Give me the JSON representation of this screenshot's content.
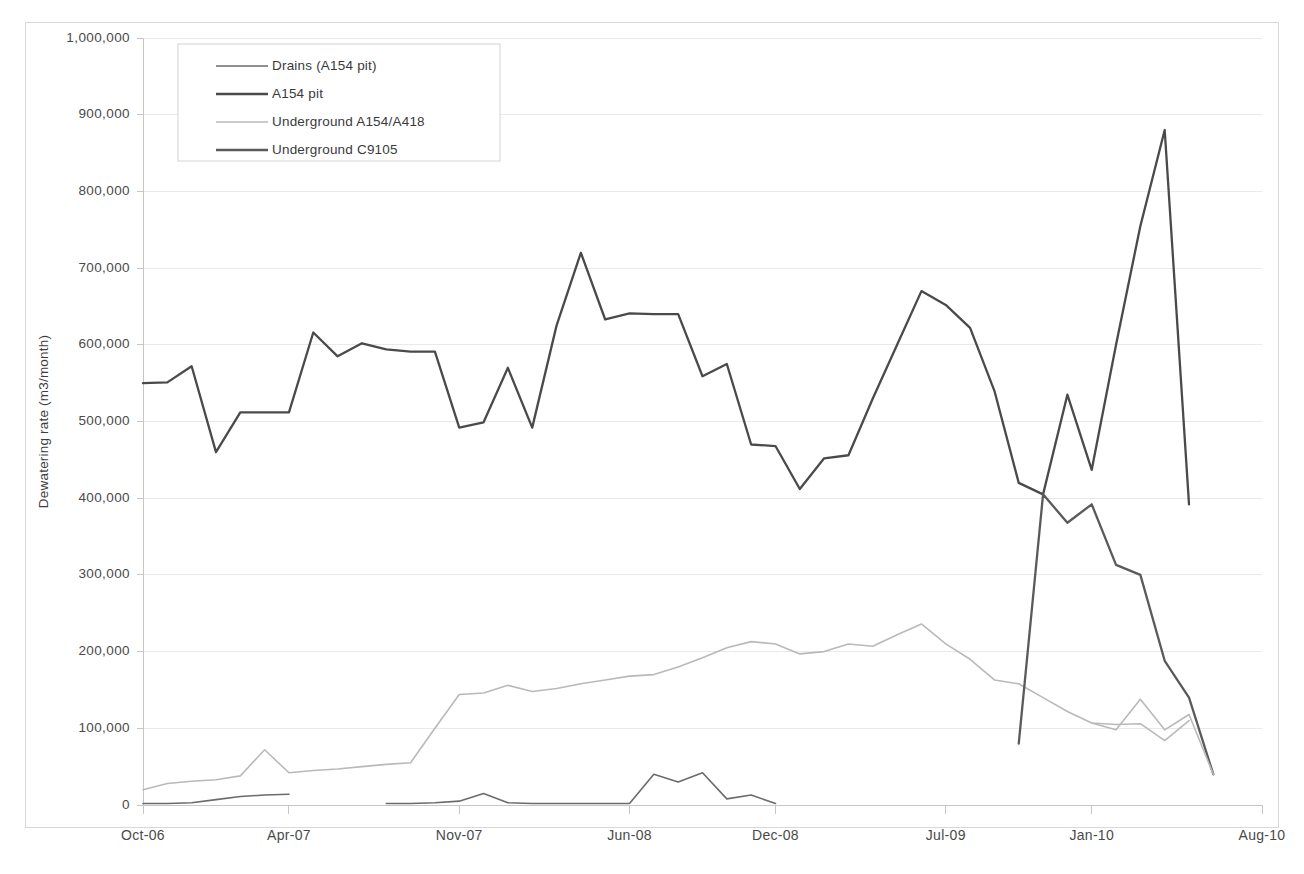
{
  "chart_data": {
    "type": "line",
    "title": "",
    "xlabel": "",
    "ylabel": "Dewatering rate (m3/month)",
    "ylim": [
      0,
      1000000
    ],
    "yticks": [
      0,
      100000,
      200000,
      300000,
      400000,
      500000,
      600000,
      700000,
      800000,
      900000,
      1000000
    ],
    "ytick_labels": [
      "0",
      "100,000",
      "200,000",
      "300,000",
      "400,000",
      "500,000",
      "600,000",
      "700,000",
      "800,000",
      "900,000",
      "1,000,000"
    ],
    "xlim": [
      0,
      46
    ],
    "xticks": [
      0,
      6,
      13,
      20,
      26,
      33,
      39,
      46
    ],
    "xtick_labels": [
      "Oct-06",
      "Apr-07",
      "Nov-07",
      "Jun-08",
      "Dec-08",
      "Jul-09",
      "Jan-10",
      "Aug-10"
    ],
    "grid": true,
    "legend_position": "top-left",
    "series": [
      {
        "name": "Drains (A154 pit)",
        "color": "#6b6b6b",
        "width": 1.6,
        "x": [
          0,
          1,
          2,
          3,
          4,
          5,
          6,
          7,
          8,
          9,
          10,
          11,
          12,
          13,
          14,
          15,
          16,
          17,
          18,
          19,
          20,
          21,
          22,
          23,
          24,
          25,
          26,
          27,
          28,
          29,
          30,
          31,
          32
        ],
        "values": [
          2000,
          2000,
          3000,
          7000,
          11000,
          13000,
          14000,
          null,
          null,
          null,
          2000,
          2000,
          3000,
          5000,
          15000,
          3000,
          2000,
          2000,
          2000,
          2000,
          2000,
          40000,
          30000,
          42000,
          8000,
          13000,
          2000,
          null,
          null,
          null,
          null,
          null,
          null
        ]
      },
      {
        "name": "A154 pit",
        "color": "#4a4a4a",
        "width": 2.3,
        "x": [
          0,
          1,
          2,
          3,
          4,
          5,
          6,
          7,
          8,
          9,
          10,
          11,
          12,
          13,
          14,
          15,
          16,
          17,
          18,
          19,
          20,
          21,
          22,
          23,
          24,
          25,
          26,
          27,
          28,
          29,
          30,
          31,
          32,
          33,
          34,
          35,
          36,
          37,
          38,
          39,
          40,
          41,
          42,
          43,
          44
        ],
        "values": [
          550000,
          551000,
          572000,
          460000,
          512000,
          512000,
          512000,
          616000,
          585000,
          602000,
          594000,
          591000,
          591000,
          492000,
          499000,
          570000,
          492000,
          625000,
          720000,
          633000,
          641000,
          640000,
          640000,
          559000,
          575000,
          470000,
          468000,
          412000,
          452000,
          456000,
          530000,
          600000,
          670000,
          652000,
          622000,
          540000,
          420000,
          405000,
          535000,
          437000,
          600000,
          755000,
          880000,
          392000,
          null
        ]
      },
      {
        "name": "Underground A154/A418",
        "color": "#b9b9b9",
        "width": 1.6,
        "x": [
          0,
          1,
          2,
          3,
          4,
          5,
          6,
          7,
          8,
          9,
          10,
          11,
          12,
          13,
          14,
          15,
          16,
          17,
          18,
          19,
          20,
          21,
          22,
          23,
          24,
          25,
          26,
          27,
          28,
          29,
          30,
          31,
          32,
          33,
          34,
          35,
          36,
          37,
          38,
          39,
          40,
          41,
          42,
          43
        ],
        "values": [
          20000,
          28000,
          31000,
          33000,
          38000,
          72000,
          42000,
          45000,
          47000,
          50000,
          53000,
          55000,
          100000,
          144000,
          146000,
          156000,
          148000,
          152000,
          158000,
          163000,
          168000,
          170000,
          180000,
          192000,
          205000,
          213000,
          210000,
          197000,
          200000,
          210000,
          207000,
          222000,
          236000,
          210000,
          190000,
          163000,
          158000,
          140000,
          122000,
          107000,
          105000,
          106000,
          84000,
          110000
        ]
      },
      {
        "name": "Underground C9105",
        "color": "#5a5a5a",
        "width": 2.3,
        "x": [
          36,
          37,
          38,
          39,
          40,
          41,
          42,
          43,
          44
        ],
        "values": [
          80000,
          405000,
          368000,
          392000,
          313000,
          300000,
          188000,
          140000,
          40000
        ]
      }
    ],
    "tail_segments": [
      {
        "name": "Underground A154/A418 tail",
        "color": "#b9b9b9",
        "width": 1.6,
        "x": [
          39,
          40,
          41,
          42,
          43,
          44
        ],
        "values": [
          107000,
          98000,
          138000,
          98000,
          118000,
          40000
        ]
      }
    ]
  },
  "legend": {
    "entries": [
      {
        "label": "Drains (A154 pit)",
        "color": "#6b6b6b",
        "width": 1.6
      },
      {
        "label": "A154 pit",
        "color": "#4a4a4a",
        "width": 2.3
      },
      {
        "label": "Underground A154/A418",
        "color": "#b9b9b9",
        "width": 1.6
      },
      {
        "label": "Underground C9105",
        "color": "#5a5a5a",
        "width": 2.3
      }
    ]
  },
  "axes": {
    "y_title": "Dewatering rate (m3/month)"
  },
  "colors": {
    "grid": "#e9e9e9",
    "axis": "#c6c6c6",
    "frame": "#d8d8d8",
    "text": "#4a4a4a",
    "background": "#ffffff"
  }
}
